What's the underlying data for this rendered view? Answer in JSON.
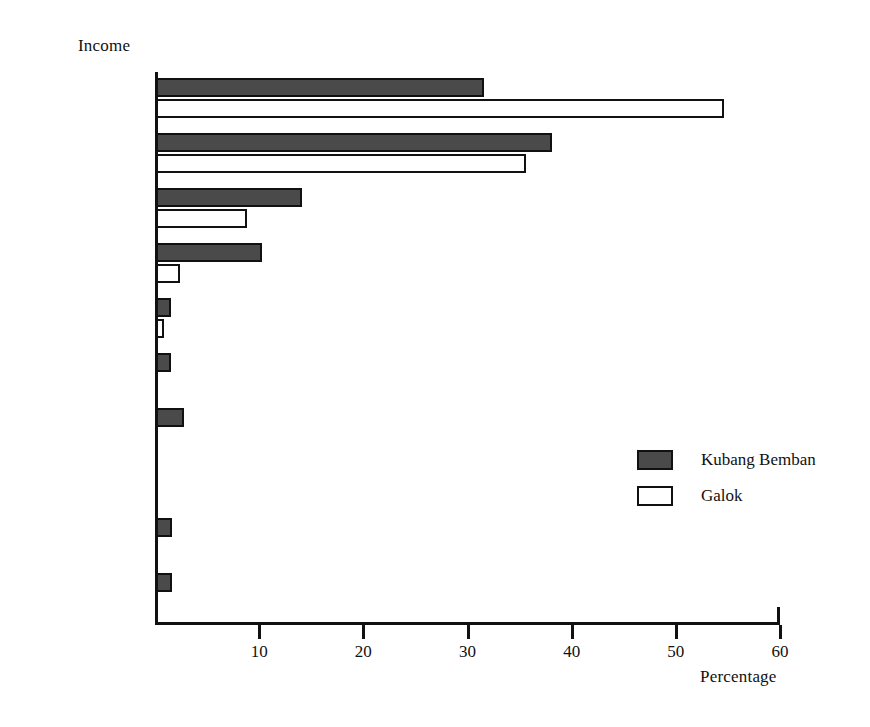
{
  "chart_data": {
    "type": "bar",
    "orientation": "horizontal",
    "title": "",
    "xlabel": "Percentage",
    "ylabel": "Income",
    "xlim": [
      0,
      60
    ],
    "xticks": [
      10,
      20,
      30,
      40,
      50,
      60
    ],
    "xtick_labels": [
      "10",
      "20",
      "30",
      "40",
      "50",
      "60"
    ],
    "grid": false,
    "legend_position": "center-right",
    "categories": [
      "0–999",
      "1,000–1,999",
      "2,000–2,999",
      "3,000–3,999",
      "4,000–4,999",
      "5,000–5,999",
      "6,000–6,999",
      "7,000–7,999",
      "8,000–8,999",
      "9,000–"
    ],
    "series": [
      {
        "name": "Kubang Bemban",
        "color": "#4a4a4a",
        "values": [
          31.5,
          38.0,
          14.0,
          10.2,
          1.4,
          1.4,
          2.7,
          0.0,
          1.5,
          1.5
        ]
      },
      {
        "name": "Galok",
        "color": "#ffffff",
        "values": [
          54.5,
          35.5,
          8.7,
          2.3,
          0.8,
          0.0,
          0.0,
          0.0,
          0.0,
          0.0
        ]
      }
    ]
  },
  "legend": {
    "items": [
      {
        "label": "Kubang Bemban",
        "swatch": "kubang"
      },
      {
        "label": "Galok",
        "swatch": "galok"
      }
    ]
  }
}
